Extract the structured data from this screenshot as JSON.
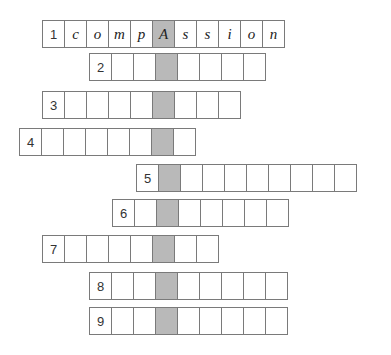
{
  "puzzle": {
    "type": "crossword-hidden-column",
    "cell_width": 23,
    "shaded_column": 6,
    "colors": {
      "shaded": "#b9b9b9",
      "border": "#7a7a7a",
      "background": "#ffffff"
    },
    "rows": [
      {
        "number": "1",
        "start_col": 1,
        "top": 20,
        "length": 10,
        "letters": [
          "c",
          "o",
          "m",
          "p",
          "A",
          "s",
          "s",
          "i",
          "o",
          "n"
        ]
      },
      {
        "number": "2",
        "start_col": 3,
        "top": 53,
        "length": 7,
        "letters": [
          "",
          "",
          "",
          "",
          "",
          "",
          ""
        ]
      },
      {
        "number": "3",
        "start_col": 1,
        "top": 91,
        "length": 8,
        "letters": [
          "",
          "",
          "",
          "",
          "",
          "",
          "",
          ""
        ]
      },
      {
        "number": "4",
        "start_col": 0,
        "top": 128,
        "length": 7,
        "letters": [
          "",
          "",
          "",
          "",
          "",
          "",
          ""
        ]
      },
      {
        "number": "5",
        "start_col": 5,
        "top": 164,
        "length": 9,
        "letters": [
          "",
          "",
          "",
          "",
          "",
          "",
          "",
          "",
          ""
        ]
      },
      {
        "number": "6",
        "start_col": 4,
        "top": 199,
        "length": 7,
        "letters": [
          "",
          "",
          "",
          "",
          "",
          "",
          ""
        ]
      },
      {
        "number": "7",
        "start_col": 1,
        "top": 235,
        "length": 7,
        "letters": [
          "",
          "",
          "",
          "",
          "",
          "",
          ""
        ]
      },
      {
        "number": "8",
        "start_col": 3,
        "top": 272,
        "length": 8,
        "letters": [
          "",
          "",
          "",
          "",
          "",
          "",
          "",
          ""
        ]
      },
      {
        "number": "9",
        "start_col": 3,
        "top": 307,
        "length": 8,
        "letters": [
          "",
          "",
          "",
          "",
          "",
          "",
          "",
          ""
        ]
      }
    ]
  }
}
